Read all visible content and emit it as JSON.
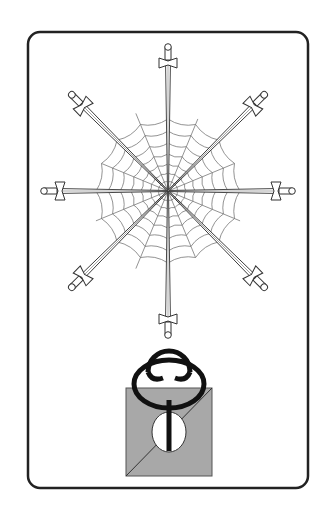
{
  "card": {
    "description": "Illustrated card: eight swords radiating from a spider web with a symbol below",
    "colors": {
      "background": "#ffffff",
      "frame": "#222222",
      "line": "#333333",
      "web": "#777777",
      "box_fill": "#a8a8a8",
      "symbol": "#111111"
    },
    "swords": {
      "count": 8,
      "angles_deg": [
        0,
        45,
        90,
        135,
        180,
        225,
        270,
        315
      ]
    },
    "symbol": {
      "name": "looped-figure-over-square"
    }
  }
}
